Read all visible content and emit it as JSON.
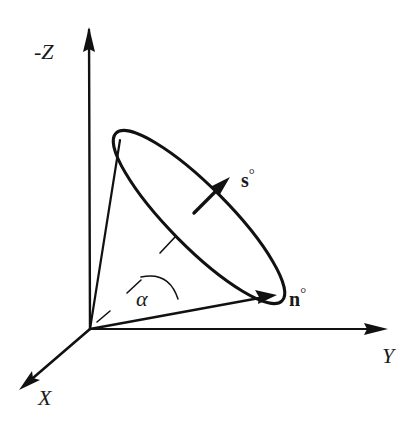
{
  "diagram": {
    "title": "",
    "axes": {
      "z": {
        "label": "-Z"
      },
      "y": {
        "label": "Y"
      },
      "x": {
        "label": "X"
      }
    },
    "vectors": {
      "s": {
        "label": "s",
        "superscript": "°"
      },
      "n": {
        "label": "n",
        "superscript": "°"
      }
    },
    "angle": {
      "label": "α"
    },
    "colors": {
      "ink": "#111111",
      "background": "#ffffff"
    }
  }
}
